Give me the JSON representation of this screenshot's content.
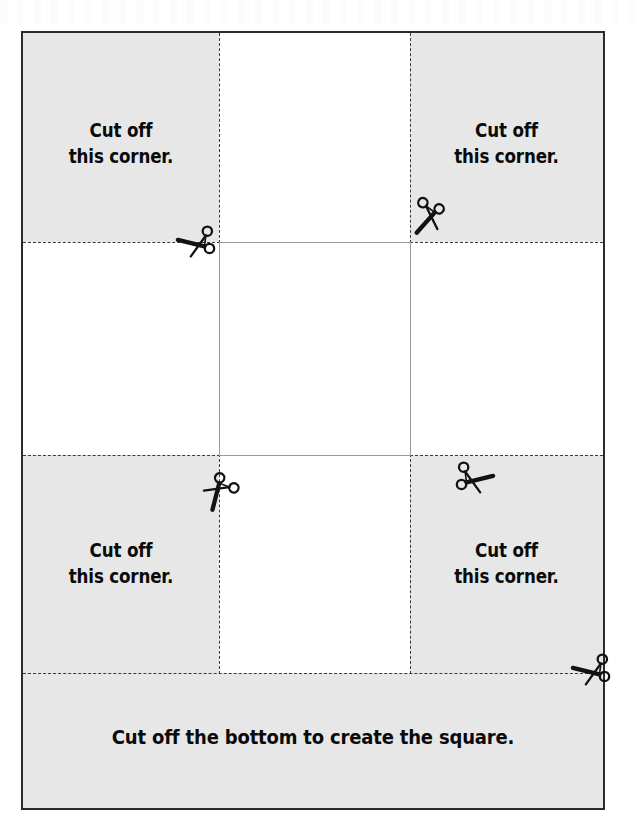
{
  "document": {
    "title": "Cut-out square template worksheet",
    "sheet": {
      "border_color": "#2b2b2b",
      "shade_color": "#e7e7e7",
      "guide_color": "#3a3a3a",
      "fold_color": "#9a9a9a"
    }
  },
  "labels": {
    "corner_top_left": "Cut off\nthis corner.",
    "corner_top_right": "Cut off\nthis corner.",
    "corner_bottom_left": "Cut off\nthis corner.",
    "corner_bottom_right": "Cut off\nthis corner.",
    "bottom_strip": "Cut off the bottom to create the square."
  },
  "icons": {
    "scissors_top_left": "scissors-icon",
    "scissors_top_right": "scissors-icon",
    "scissors_mid_left": "scissors-icon",
    "scissors_mid_right": "scissors-icon",
    "scissors_bottom_right": "scissors-icon"
  },
  "geometry": {
    "sheet_left": 21,
    "sheet_top": 31,
    "sheet_right": 605,
    "sheet_bottom": 810,
    "column_guides": [
      219,
      410
    ],
    "row_guides": [
      242,
      455,
      673
    ]
  }
}
